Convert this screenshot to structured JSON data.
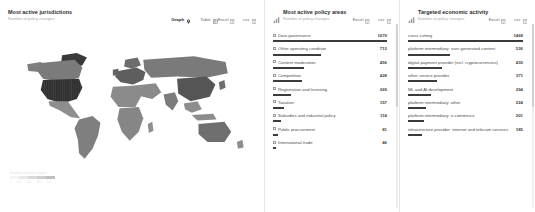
{
  "map_panel": {
    "title": "Most active jurisdictions",
    "subtitle": "Number of policy changes",
    "view_toggles": [
      {
        "label": "Graph",
        "icon": "map-pin-icon",
        "active": true
      },
      {
        "label": "Table",
        "icon": "table-icon",
        "active": false
      }
    ],
    "exports": [
      {
        "label": "Excel",
        "icon": "excel-icon"
      },
      {
        "label": "csv",
        "icon": "csv-icon"
      }
    ],
    "legend": {
      "title": "Number of policy changes",
      "ticks": [
        "0",
        "200",
        "400",
        "600",
        "800"
      ]
    }
  },
  "policy_panel": {
    "icon": "bar-chart-icon",
    "title": "Most active policy areas",
    "subtitle": "Number of policy changes",
    "exports": [
      {
        "label": "Excel",
        "icon": "excel-icon"
      },
      {
        "label": "csv",
        "icon": "csv-icon"
      }
    ]
  },
  "econ_panel": {
    "icon": "bar-chart-icon",
    "title": "Targeted economic activity",
    "subtitle": "Number of policy changes",
    "exports": [
      {
        "label": "Excel",
        "icon": "excel-icon"
      },
      {
        "label": "csv",
        "icon": "csv-icon"
      }
    ]
  },
  "colors": {
    "bar": "#3b3b3b",
    "text_primary": "#2b2b2b",
    "text_muted": "#a8a8a8",
    "panel_divider": "#e8e8e8",
    "map_land_base": "#8e8e8e",
    "map_land_dark": "#2f2f2f",
    "map_land_mid": "#6a6a6a"
  },
  "chart_data": [
    {
      "type": "bar",
      "title": "Most active policy areas",
      "xlabel": "",
      "ylabel": "Number of policy changes",
      "orientation": "horizontal",
      "max": 1679,
      "categories": [
        "Data governance",
        "Other operating condition",
        "Content moderation",
        "Competition",
        "Registration and licensing",
        "Taxation",
        "Subsidies and industrial policy",
        "Public procurement",
        "International trade"
      ],
      "values": [
        1679,
        713,
        456,
        428,
        269,
        157,
        114,
        81,
        46
      ]
    },
    {
      "type": "bar",
      "title": "Targeted economic activity",
      "xlabel": "",
      "ylabel": "Number of policy changes",
      "orientation": "horizontal",
      "max": 1468,
      "categories": [
        "cross cutting",
        "platform intermediary: user-generated content",
        "digital payment provider (incl. cryptocurrencies)",
        "other service provider",
        "ML and AI development",
        "platform intermediary: other",
        "platform intermediary: e-commerce",
        "infrastructure provider: internet and telecom services"
      ],
      "values": [
        1468,
        536,
        430,
        371,
        294,
        224,
        201,
        185
      ]
    },
    {
      "type": "heatmap",
      "subtype": "choropleth",
      "title": "Most active jurisdictions",
      "ylabel": "Number of policy changes",
      "regions": [
        {
          "name": "United States",
          "intensity": 1.0
        },
        {
          "name": "China",
          "intensity": 0.62
        },
        {
          "name": "Europe",
          "intensity": 0.55
        },
        {
          "name": "Canada",
          "intensity": 0.42
        },
        {
          "name": "India",
          "intensity": 0.4
        },
        {
          "name": "Russia",
          "intensity": 0.38
        },
        {
          "name": "Brazil",
          "intensity": 0.35
        },
        {
          "name": "Australia",
          "intensity": 0.33
        }
      ]
    }
  ]
}
